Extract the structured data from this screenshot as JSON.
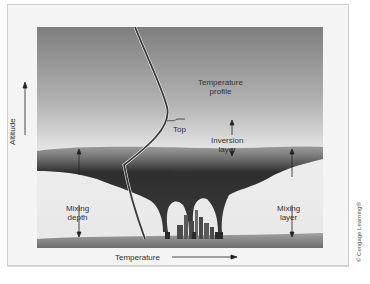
{
  "diagram": {
    "axes": {
      "y_label": "Altitude",
      "x_label": "Temperature"
    },
    "labels": {
      "temperature_profile_line1": "Temperature",
      "temperature_profile_line2": "profile",
      "top": "Top",
      "inversion_line1": "Inversion",
      "inversion_line2": "layer",
      "base": "Base",
      "mixing_depth_line1": "Mixing",
      "mixing_depth_line2": "depth",
      "mixing_layer_line1": "Mixing",
      "mixing_layer_line2": "layer"
    },
    "credit": "© Cengage Learning®",
    "colors": {
      "sky_top": "#8a8a8a",
      "sky_bottom": "#f0f0f0",
      "smog": "#3a3a3a",
      "ground": "#8c8c8c",
      "profile_line": "#3b3b3b"
    }
  }
}
